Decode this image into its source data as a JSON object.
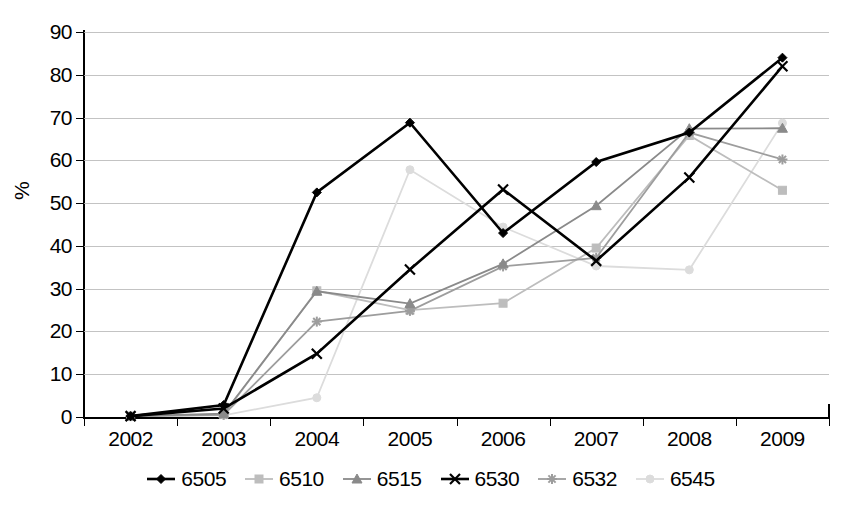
{
  "chart_data": {
    "type": "line",
    "title": "",
    "xlabel": "",
    "ylabel": "%",
    "categories": [
      "2002",
      "2003",
      "2004",
      "2005",
      "2006",
      "2007",
      "2008",
      "2009"
    ],
    "ylim": [
      0,
      90
    ],
    "ytick_step": 10,
    "yticks": [
      "90",
      "80",
      "70",
      "60",
      "50",
      "40",
      "30",
      "20",
      "10",
      "0"
    ],
    "grid": true,
    "legend_position": "bottom",
    "series": [
      {
        "name": "6505",
        "marker": "diamond",
        "color": "#000000",
        "values": [
          0.2,
          2.8,
          52.5,
          68.8,
          43.0,
          59.6,
          66.5,
          84.0
        ]
      },
      {
        "name": "6510",
        "marker": "square",
        "color": "#bdbdbd",
        "values": [
          0.2,
          0.6,
          29.5,
          25.0,
          26.6,
          39.5,
          65.8,
          53.0
        ]
      },
      {
        "name": "6515",
        "marker": "triangle",
        "color": "#8a8a8a",
        "values": [
          0.2,
          0.8,
          29.4,
          26.5,
          35.8,
          49.4,
          67.4,
          67.5
        ]
      },
      {
        "name": "6530",
        "marker": "cross-x",
        "color": "#000000",
        "values": [
          0.2,
          2.0,
          14.8,
          34.5,
          53.2,
          36.5,
          56.0,
          82.0
        ]
      },
      {
        "name": "6532",
        "marker": "asterisk",
        "color": "#9d9d9d",
        "values": [
          0.2,
          0.5,
          22.3,
          24.8,
          35.2,
          37.2,
          66.5,
          60.2
        ]
      },
      {
        "name": "6545",
        "marker": "circle",
        "color": "#dcdcdc",
        "values": [
          0.2,
          0.4,
          4.5,
          57.8,
          44.4,
          35.3,
          34.4,
          68.7
        ]
      }
    ]
  },
  "axes": {
    "y_axis_label": "%"
  }
}
